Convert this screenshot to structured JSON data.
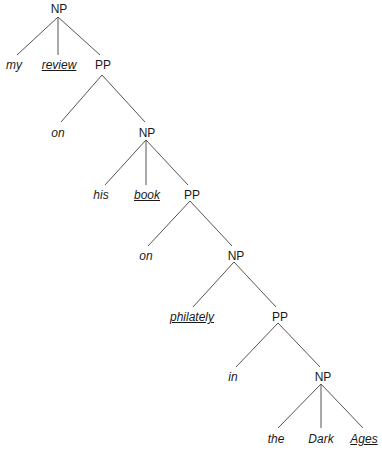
{
  "diagram": {
    "type": "syntax-tree",
    "phrase": "my review on his book on philately in the Dark Ages",
    "line_color": "#555555",
    "text_color": "#1a1a1a",
    "nodes": [
      {
        "id": "np1",
        "label": "NP",
        "kind": "category",
        "x": 59,
        "y": 2
      },
      {
        "id": "w_my",
        "label": "my",
        "kind": "word",
        "head": false,
        "x": 14,
        "y": 58
      },
      {
        "id": "w_review",
        "label": "review",
        "kind": "word",
        "head": true,
        "x": 59,
        "y": 58
      },
      {
        "id": "pp1",
        "label": "PP",
        "kind": "category",
        "x": 103,
        "y": 58
      },
      {
        "id": "w_on1",
        "label": "on",
        "kind": "word",
        "head": false,
        "x": 58,
        "y": 126
      },
      {
        "id": "np2",
        "label": "NP",
        "kind": "category",
        "x": 147,
        "y": 126
      },
      {
        "id": "w_his",
        "label": "his",
        "kind": "word",
        "head": false,
        "x": 101,
        "y": 188
      },
      {
        "id": "w_book",
        "label": "book",
        "kind": "word",
        "head": true,
        "x": 147,
        "y": 188
      },
      {
        "id": "pp2",
        "label": "PP",
        "kind": "category",
        "x": 192,
        "y": 188
      },
      {
        "id": "w_on2",
        "label": "on",
        "kind": "word",
        "head": false,
        "x": 146,
        "y": 249
      },
      {
        "id": "np3",
        "label": "NP",
        "kind": "category",
        "x": 236,
        "y": 249
      },
      {
        "id": "w_philately",
        "label": "philately",
        "kind": "word",
        "head": true,
        "x": 192,
        "y": 310
      },
      {
        "id": "pp3",
        "label": "PP",
        "kind": "category",
        "x": 280,
        "y": 310
      },
      {
        "id": "w_in",
        "label": "in",
        "kind": "word",
        "head": false,
        "x": 233,
        "y": 370
      },
      {
        "id": "np4",
        "label": "NP",
        "kind": "category",
        "x": 323,
        "y": 370
      },
      {
        "id": "w_the",
        "label": "the",
        "kind": "word",
        "head": false,
        "x": 276,
        "y": 432
      },
      {
        "id": "w_dark",
        "label": "Dark",
        "kind": "word",
        "head": false,
        "x": 321,
        "y": 432
      },
      {
        "id": "w_ages",
        "label": "Ages",
        "kind": "word",
        "head": true,
        "x": 364,
        "y": 432
      }
    ],
    "edges": [
      {
        "from": "np1",
        "to": "w_my",
        "x1": 58,
        "y1": 17,
        "x2": 17,
        "y2": 55
      },
      {
        "from": "np1",
        "to": "w_review",
        "x1": 58,
        "y1": 17,
        "x2": 58,
        "y2": 55
      },
      {
        "from": "np1",
        "to": "pp1",
        "x1": 58,
        "y1": 17,
        "x2": 100,
        "y2": 55
      },
      {
        "from": "pp1",
        "to": "w_on1",
        "x1": 102,
        "y1": 75,
        "x2": 61,
        "y2": 122
      },
      {
        "from": "pp1",
        "to": "np2",
        "x1": 102,
        "y1": 75,
        "x2": 145,
        "y2": 122
      },
      {
        "from": "np2",
        "to": "w_his",
        "x1": 146,
        "y1": 140,
        "x2": 105,
        "y2": 185
      },
      {
        "from": "np2",
        "to": "w_book",
        "x1": 146,
        "y1": 140,
        "x2": 146,
        "y2": 185
      },
      {
        "from": "np2",
        "to": "pp2",
        "x1": 146,
        "y1": 140,
        "x2": 188,
        "y2": 185
      },
      {
        "from": "pp2",
        "to": "w_on2",
        "x1": 190,
        "y1": 201,
        "x2": 148,
        "y2": 246
      },
      {
        "from": "pp2",
        "to": "np3",
        "x1": 190,
        "y1": 201,
        "x2": 232,
        "y2": 246
      },
      {
        "from": "np3",
        "to": "w_philately",
        "x1": 234,
        "y1": 262,
        "x2": 193,
        "y2": 307
      },
      {
        "from": "np3",
        "to": "pp3",
        "x1": 234,
        "y1": 262,
        "x2": 276,
        "y2": 307
      },
      {
        "from": "pp3",
        "to": "w_in",
        "x1": 278,
        "y1": 323,
        "x2": 236,
        "y2": 367
      },
      {
        "from": "pp3",
        "to": "np4",
        "x1": 278,
        "y1": 323,
        "x2": 320,
        "y2": 367
      },
      {
        "from": "np4",
        "to": "w_the",
        "x1": 321,
        "y1": 384,
        "x2": 278,
        "y2": 428
      },
      {
        "from": "np4",
        "to": "w_dark",
        "x1": 321,
        "y1": 384,
        "x2": 321,
        "y2": 428
      },
      {
        "from": "np4",
        "to": "w_ages",
        "x1": 321,
        "y1": 384,
        "x2": 363,
        "y2": 428
      }
    ]
  }
}
